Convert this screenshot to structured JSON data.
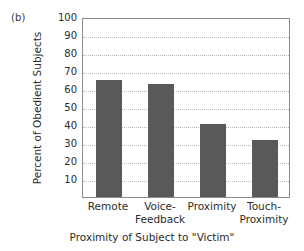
{
  "panel": {
    "label": "(b)"
  },
  "chart_data": {
    "type": "bar",
    "title": "",
    "subtitle": "",
    "panel_label": "(b)",
    "categories": [
      "Remote",
      "Voice-Feedback",
      "Proximity",
      "Touch-Proximity"
    ],
    "category_lines": [
      [
        "Remote",
        ""
      ],
      [
        "Voice-",
        "Feedback"
      ],
      [
        "Proximity",
        ""
      ],
      [
        "Touch-",
        "Proximity"
      ]
    ],
    "values": [
      65,
      63,
      40.5,
      31.5
    ],
    "xlabel": "Proximity of Subject to \"Victim\"",
    "ylabel": "Percent of Obedient Subjects",
    "ylim": [
      0,
      100
    ],
    "ytick_values": [
      10,
      20,
      30,
      40,
      50,
      60,
      70,
      80,
      90,
      100
    ],
    "ytick_labels": [
      "10",
      "20",
      "30",
      "40",
      "50",
      "60",
      "70",
      "80",
      "90",
      "100"
    ],
    "grid": "horizontal-dotted",
    "legend": "none",
    "bar_color": "#595959",
    "axis_color": "#8a8a8a",
    "grid_color": "#b9b9b9"
  }
}
